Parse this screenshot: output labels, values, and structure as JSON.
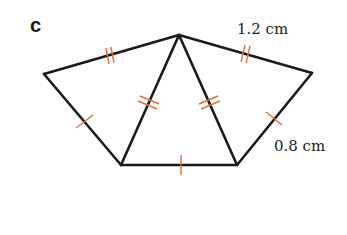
{
  "part_label": "c",
  "measurements": {
    "top_right_edge": "1.2 cm",
    "right_edge": "0.8 cm"
  },
  "colors": {
    "lines": "#1a1a1a",
    "tick_marks": "#e0703a",
    "background": "#ffffff"
  },
  "shape": {
    "description": "Pentagon divided into three triangles from apex; equal-length tick marks indicate two sides of 1.2 cm (double ticks) and three sides of 0.8 cm (single ticks)",
    "vertices": {
      "apex": [
        179,
        35
      ],
      "left": [
        44,
        74
      ],
      "right": [
        312,
        73
      ],
      "bottom_left": [
        121,
        165
      ],
      "bottom_right": [
        237,
        165
      ]
    }
  }
}
